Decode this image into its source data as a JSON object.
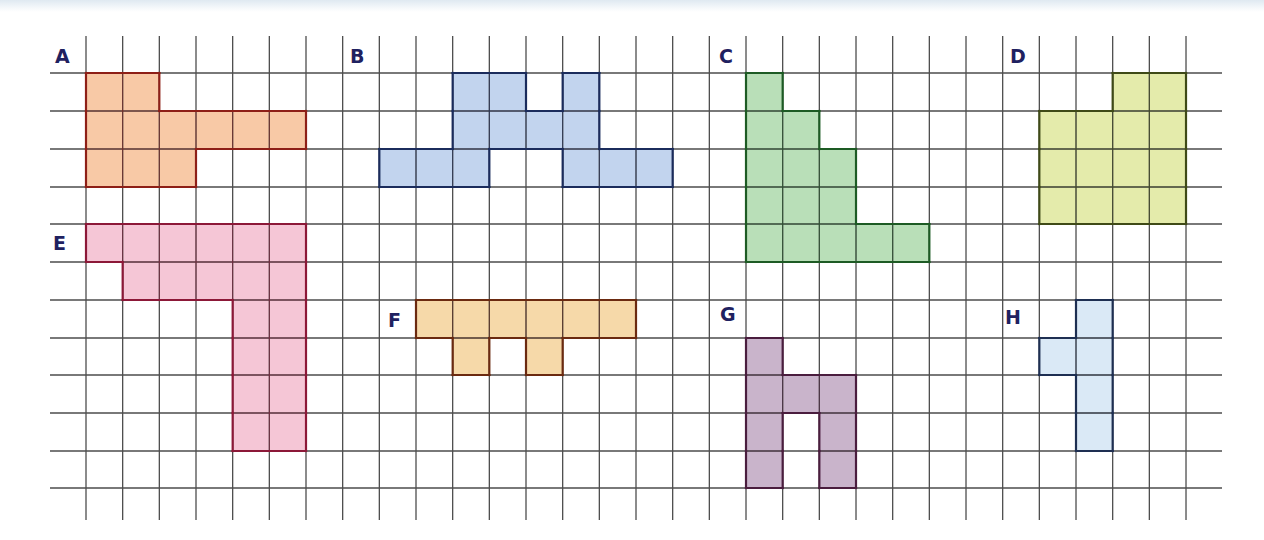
{
  "figure": {
    "grid": {
      "line_color": "#4d4d4d",
      "col_line_x0": 86,
      "col_spacing": 36.667,
      "col_line_count": 31,
      "col_line_top": 36,
      "col_line_bottom": 520,
      "row_lines_y": [
        73,
        111,
        149,
        187,
        224,
        262,
        300,
        338,
        375,
        413,
        451,
        488
      ],
      "row_line_left": 50,
      "row_line_right": 1222
    },
    "shapes": [
      {
        "label": "A",
        "label_pos": [
          55,
          47
        ],
        "fill": "#f8c9a6",
        "stroke": "#8e1f17",
        "cells": [
          [
            0,
            0
          ],
          [
            0,
            1
          ],
          [
            1,
            0
          ],
          [
            1,
            1
          ],
          [
            1,
            2
          ],
          [
            1,
            3
          ],
          [
            1,
            4
          ],
          [
            1,
            5
          ],
          [
            2,
            0
          ],
          [
            2,
            1
          ],
          [
            2,
            2
          ]
        ]
      },
      {
        "label": "B",
        "label_pos": [
          350,
          47
        ],
        "fill": "#c2d4ee",
        "stroke": "#1b2c5c",
        "cells": [
          [
            0,
            10
          ],
          [
            0,
            11
          ],
          [
            0,
            13
          ],
          [
            1,
            10
          ],
          [
            1,
            11
          ],
          [
            1,
            12
          ],
          [
            1,
            13
          ],
          [
            2,
            8
          ],
          [
            2,
            9
          ],
          [
            2,
            10
          ],
          [
            2,
            13
          ],
          [
            2,
            14
          ],
          [
            2,
            15
          ]
        ]
      },
      {
        "label": "C",
        "label_pos": [
          719,
          47
        ],
        "fill": "#b9dfb8",
        "stroke": "#1d5b24",
        "cells": [
          [
            0,
            18
          ],
          [
            1,
            18
          ],
          [
            1,
            19
          ],
          [
            2,
            18
          ],
          [
            2,
            19
          ],
          [
            2,
            20
          ],
          [
            3,
            18
          ],
          [
            3,
            19
          ],
          [
            3,
            20
          ],
          [
            4,
            18
          ],
          [
            4,
            19
          ],
          [
            4,
            20
          ],
          [
            4,
            21
          ],
          [
            4,
            22
          ]
        ]
      },
      {
        "label": "D",
        "label_pos": [
          1010,
          47
        ],
        "fill": "#e4ebab",
        "stroke": "#3f4a17",
        "cells": [
          [
            0,
            28
          ],
          [
            0,
            29
          ],
          [
            1,
            26
          ],
          [
            1,
            27
          ],
          [
            1,
            28
          ],
          [
            1,
            29
          ],
          [
            2,
            26
          ],
          [
            2,
            27
          ],
          [
            2,
            28
          ],
          [
            2,
            29
          ],
          [
            3,
            26
          ],
          [
            3,
            27
          ],
          [
            3,
            28
          ],
          [
            3,
            29
          ]
        ]
      },
      {
        "label": "E",
        "label_pos": [
          53,
          234
        ],
        "fill": "#f5c6d6",
        "stroke": "#8c1838",
        "cells": [
          [
            4,
            0
          ],
          [
            4,
            1
          ],
          [
            4,
            2
          ],
          [
            4,
            3
          ],
          [
            4,
            4
          ],
          [
            4,
            5
          ],
          [
            5,
            1
          ],
          [
            5,
            2
          ],
          [
            5,
            3
          ],
          [
            5,
            4
          ],
          [
            5,
            5
          ],
          [
            6,
            4
          ],
          [
            6,
            5
          ],
          [
            7,
            4
          ],
          [
            7,
            5
          ],
          [
            8,
            4
          ],
          [
            8,
            5
          ],
          [
            9,
            4
          ],
          [
            9,
            5
          ]
        ]
      },
      {
        "label": "F",
        "label_pos": [
          388,
          311
        ],
        "fill": "#f6d9a9",
        "stroke": "#6b2a10",
        "cells": [
          [
            6,
            9
          ],
          [
            6,
            10
          ],
          [
            6,
            11
          ],
          [
            6,
            12
          ],
          [
            6,
            13
          ],
          [
            6,
            14
          ],
          [
            7,
            10
          ],
          [
            7,
            12
          ]
        ]
      },
      {
        "label": "G",
        "label_pos": [
          720,
          305
        ],
        "fill": "#c9b4cb",
        "stroke": "#4a1d3e",
        "cells": [
          [
            7,
            18
          ],
          [
            8,
            18
          ],
          [
            8,
            19
          ],
          [
            8,
            20
          ],
          [
            9,
            18
          ],
          [
            9,
            20
          ],
          [
            10,
            18
          ],
          [
            10,
            20
          ]
        ]
      },
      {
        "label": "H",
        "label_pos": [
          1005,
          308
        ],
        "fill": "#dae9f6",
        "stroke": "#1e2f52",
        "cells": [
          [
            6,
            27
          ],
          [
            7,
            26
          ],
          [
            7,
            27
          ],
          [
            8,
            27
          ],
          [
            9,
            27
          ]
        ]
      }
    ]
  }
}
